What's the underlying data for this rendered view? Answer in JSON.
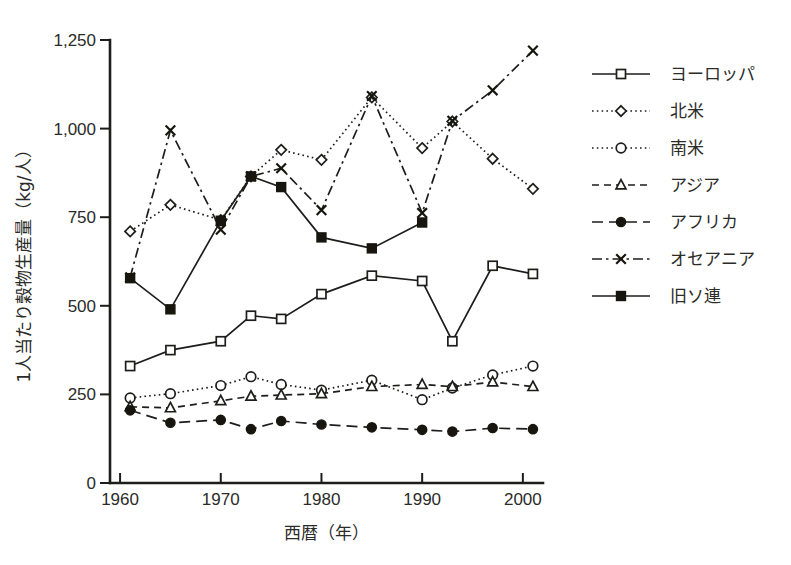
{
  "chart_data": {
    "type": "line",
    "title": "",
    "xlabel": "西暦（年）",
    "ylabel": "1人当たり穀物生産量（kg/人）",
    "xlim": [
      1959,
      2002
    ],
    "ylim": [
      0,
      1250
    ],
    "xticks": [
      1960,
      1970,
      1980,
      1990,
      2000
    ],
    "xtick_labels": [
      "1960",
      "1970",
      "1980",
      "1990",
      "2000"
    ],
    "yticks": [
      0,
      250,
      500,
      750,
      1000,
      1250
    ],
    "ytick_labels": [
      "0",
      "250",
      "500",
      "750",
      "1,000",
      "1,250"
    ],
    "grid": false,
    "legend_position": "right",
    "series": [
      {
        "name": "ヨーロッパ",
        "marker": "open-square",
        "line": "solid",
        "x": [
          1961,
          1965,
          1970,
          1973,
          1976,
          1980,
          1985,
          1990,
          1993,
          1997,
          2001
        ],
        "values": [
          330,
          375,
          400,
          472,
          463,
          533,
          585,
          570,
          400,
          613,
          590
        ]
      },
      {
        "name": "北米",
        "marker": "open-diamond",
        "line": "dotted",
        "x": [
          1961,
          1965,
          1970,
          1973,
          1976,
          1980,
          1985,
          1990,
          1993,
          1997,
          2001
        ],
        "values": [
          710,
          785,
          742,
          865,
          940,
          912,
          1088,
          945,
          1020,
          915,
          830
        ]
      },
      {
        "name": "南米",
        "marker": "open-circle",
        "line": "dotted",
        "x": [
          1961,
          1965,
          1970,
          1973,
          1976,
          1980,
          1985,
          1990,
          1993,
          1997,
          2001
        ],
        "values": [
          240,
          252,
          275,
          300,
          278,
          262,
          290,
          235,
          268,
          305,
          330
        ]
      },
      {
        "name": "アジア",
        "marker": "open-triangle",
        "line": "dashed",
        "x": [
          1961,
          1965,
          1970,
          1973,
          1976,
          1980,
          1985,
          1990,
          1993,
          1997,
          2001
        ],
        "values": [
          215,
          212,
          232,
          245,
          248,
          252,
          272,
          278,
          272,
          285,
          272
        ]
      },
      {
        "name": "アフリカ",
        "marker": "solid-circle",
        "line": "long-dash",
        "x": [
          1961,
          1965,
          1970,
          1973,
          1976,
          1980,
          1985,
          1990,
          1993,
          1997,
          2001
        ],
        "values": [
          205,
          170,
          178,
          152,
          175,
          165,
          157,
          150,
          145,
          155,
          152
        ]
      },
      {
        "name": "オセアニア",
        "marker": "cross-x",
        "line": "dash-dot",
        "x": [
          1961,
          1965,
          1970,
          1973,
          1976,
          1980,
          1985,
          1990,
          1993,
          1997,
          2001
        ],
        "values": [
          580,
          995,
          715,
          865,
          888,
          770,
          1092,
          762,
          1022,
          1108,
          1220
        ]
      },
      {
        "name": "旧ソ連",
        "marker": "solid-square",
        "line": "solid",
        "x": [
          1961,
          1965,
          1970,
          1973,
          1976,
          1980,
          1985,
          1990
        ],
        "values": [
          578,
          490,
          740,
          865,
          835,
          693,
          662,
          735
        ]
      }
    ]
  },
  "legend": {
    "items": [
      {
        "label": "ヨーロッパ"
      },
      {
        "label": "北米"
      },
      {
        "label": "南米"
      },
      {
        "label": "アジア"
      },
      {
        "label": "アフリカ"
      },
      {
        "label": "オセアニア"
      },
      {
        "label": "旧ソ連"
      }
    ]
  }
}
